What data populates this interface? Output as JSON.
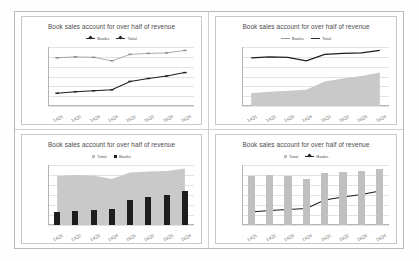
{
  "chart_data": [
    {
      "type": "line",
      "title": "Book sales account for over half of revenue",
      "categories": [
        "14Q1",
        "14Q2",
        "14Q3",
        "14Q4",
        "15Q1",
        "15Q2",
        "15Q3",
        "15Q4"
      ],
      "series": [
        {
          "name": "Books",
          "values": [
            130,
            145,
            155,
            165,
            250,
            280,
            305,
            340
          ]
        },
        {
          "name": "Total",
          "values": [
            490,
            500,
            495,
            460,
            525,
            535,
            540,
            565
          ]
        }
      ],
      "legend": [
        "Books",
        "Total"
      ],
      "legend_position": "top",
      "xlabel": "",
      "ylabel": "",
      "ylim": [
        0,
        600
      ],
      "yticks": [
        0,
        100,
        200,
        300,
        400,
        500,
        600
      ],
      "grid": true
    },
    {
      "type": "area",
      "title": "Book sales account for over half of revenue",
      "categories": [
        "14Q1",
        "14Q2",
        "14Q3",
        "14Q4",
        "15Q1",
        "15Q2",
        "15Q3",
        "15Q4"
      ],
      "series": [
        {
          "name": "Books",
          "values": [
            130,
            145,
            155,
            165,
            250,
            280,
            305,
            340
          ]
        },
        {
          "name": "Total",
          "values": [
            490,
            500,
            495,
            460,
            525,
            535,
            540,
            565
          ]
        }
      ],
      "legend": [
        "Books",
        "Total"
      ],
      "legend_position": "top",
      "xlabel": "",
      "ylabel": "",
      "ylim": [
        0,
        600
      ],
      "yticks": [
        0,
        100,
        200,
        300,
        400,
        500,
        600
      ],
      "grid": true
    },
    {
      "type": "bar",
      "title": "Book sales account for over half of revenue",
      "categories": [
        "14Q1",
        "14Q2",
        "14Q3",
        "14Q4",
        "15Q1",
        "15Q2",
        "15Q3",
        "15Q4"
      ],
      "series": [
        {
          "name": "Total",
          "values": [
            490,
            500,
            495,
            460,
            525,
            535,
            540,
            565
          ]
        },
        {
          "name": "Books",
          "values": [
            130,
            145,
            155,
            165,
            250,
            280,
            305,
            340
          ]
        }
      ],
      "legend": [
        "Total",
        "Books"
      ],
      "legend_position": "top",
      "xlabel": "",
      "ylabel": "",
      "ylim": [
        0,
        600
      ],
      "yticks": [
        0,
        100,
        200,
        300,
        400,
        500,
        600
      ],
      "grid": true
    },
    {
      "type": "bar",
      "title": "Book sales account for over half of revenue",
      "categories": [
        "14Q1",
        "14Q2",
        "14Q3",
        "14Q4",
        "15Q1",
        "15Q2",
        "15Q3",
        "15Q4"
      ],
      "series": [
        {
          "name": "Total",
          "values": [
            490,
            500,
            495,
            460,
            525,
            535,
            540,
            565
          ]
        },
        {
          "name": "Books",
          "values": [
            130,
            145,
            155,
            165,
            250,
            280,
            305,
            340
          ]
        }
      ],
      "legend": [
        "Total",
        "Books"
      ],
      "legend_position": "top",
      "xlabel": "",
      "ylabel": "",
      "ylim": [
        0,
        600
      ],
      "yticks": [
        0,
        100,
        200,
        300,
        400,
        500,
        600
      ],
      "grid": true
    }
  ],
  "colors": {
    "series_dark": "#1d1d1d",
    "series_gray": "#bdbdbd",
    "area_fill": "#c9c9c9",
    "gridline": "#e3e3e3",
    "axis": "#b5b5b5",
    "title_text": "#4a4a4a",
    "tick_text": "#6a6a6a",
    "panel_border": "#c8c8c8"
  }
}
